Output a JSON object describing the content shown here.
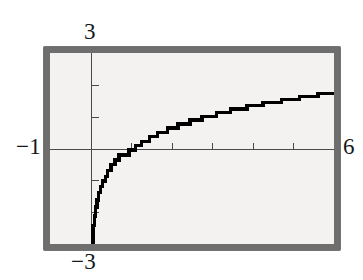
{
  "view": {
    "device": "graphing-calculator-screen",
    "background_color": "#ffffff",
    "frame_color": "#6e6e6e",
    "screen_color": "#f3f2f0",
    "trace_color": "#000000",
    "axis_color": "#4a4a4a"
  },
  "labels": {
    "y_max": "3",
    "y_min": "−3",
    "x_min": "−1",
    "x_max": "6"
  },
  "chart_data": {
    "type": "line",
    "title": "",
    "subtitle": "",
    "xlabel": "",
    "ylabel": "",
    "xlim": [
      -1,
      6
    ],
    "ylim": [
      -3,
      3
    ],
    "grid": false,
    "legend": null,
    "axes": {
      "x_axis_y_value": 0,
      "y_axis_x_value": 0,
      "x_tick_step": 1,
      "y_tick_step": 1,
      "x_ticks": [
        -1,
        0,
        1,
        2,
        3,
        4,
        5,
        6
      ],
      "y_ticks": [
        -3,
        -2,
        -1,
        0,
        1,
        2,
        3
      ],
      "tick_labels_shown": false,
      "tick_mark_length_px": 7
    },
    "annotations": [
      "window corner value 3 shown above y-axis",
      "window corner value -3 shown below y-axis",
      "window corner value -1 shown left of x-axis",
      "window corner value 6 shown right of x-axis"
    ],
    "series": [
      {
        "name": "y = ln(x)",
        "style": "stair-stepped pixel trace",
        "color": "#000000",
        "x": [
          0.06,
          0.09,
          0.12,
          0.16,
          0.2,
          0.25,
          0.3,
          0.36,
          0.42,
          0.5,
          0.6,
          0.7,
          0.82,
          0.95,
          1.1,
          1.25,
          1.45,
          1.65,
          1.9,
          2.15,
          2.45,
          2.75,
          3.1,
          3.45,
          3.85,
          4.25,
          4.7,
          5.15,
          5.6,
          5.95
        ],
        "y": [
          -2.81,
          -2.41,
          -2.12,
          -1.83,
          -1.61,
          -1.39,
          -1.2,
          -1.02,
          -0.87,
          -0.69,
          -0.51,
          -0.36,
          -0.2,
          -0.05,
          0.1,
          0.22,
          0.37,
          0.5,
          0.64,
          0.77,
          0.9,
          1.01,
          1.13,
          1.24,
          1.35,
          1.45,
          1.55,
          1.64,
          1.72,
          1.78
        ]
      }
    ]
  }
}
